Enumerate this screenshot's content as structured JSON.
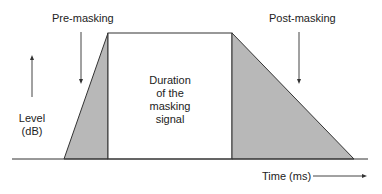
{
  "diagram": {
    "labels": {
      "pre_masking": "Pre-masking",
      "post_masking": "Post-masking",
      "duration_lines": [
        "Duration",
        "of the",
        "masking",
        "signal"
      ],
      "level_lines": [
        "Level",
        "(dB)"
      ],
      "time_axis": "Time (ms)"
    },
    "colors": {
      "shading": "#b8b8b8",
      "line": "#333333",
      "background": "#ffffff"
    },
    "regions": [
      {
        "name": "pre-masking",
        "shape": "triangle",
        "fill": "gray"
      },
      {
        "name": "masking-signal",
        "shape": "rectangle",
        "fill": "white"
      },
      {
        "name": "post-masking",
        "shape": "triangle",
        "fill": "gray"
      }
    ]
  }
}
